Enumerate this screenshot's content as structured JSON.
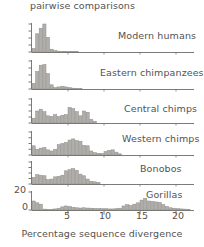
{
  "figure": {
    "y_axis_partial_label": "pairwise comparisons",
    "x_axis_title": "Percentage sequence divergence",
    "bar_color": "#b0aeaa",
    "bar_stroke": "#8f8d89",
    "axis_color": "#6e6c69",
    "text_color": "#555250",
    "background": "#ffffff"
  },
  "chart_data": {
    "type": "bar",
    "xlabel": "Percentage sequence divergence",
    "ylabel": "pairwise comparisons",
    "xlim": [
      0,
      22.5
    ],
    "xticks": [
      5,
      10,
      15,
      20
    ],
    "xtick_labels": [
      "5",
      "10",
      "15",
      "20"
    ],
    "grid": false,
    "legend": "none",
    "panel_layout": "stacked-vertical-shared-x",
    "bin_width": 0.5,
    "panels": [
      {
        "name": "Modern humans",
        "label": "Modern humans",
        "ylim": [
          0,
          20
        ],
        "yticks": [
          0,
          5,
          10,
          15,
          20
        ],
        "ytick_labels": [
          "",
          "",
          "",
          "",
          ""
        ],
        "x": [
          0.25,
          0.75,
          1.25,
          1.75,
          2.25,
          2.75,
          3.25,
          3.75,
          4.25,
          4.75,
          5.25,
          5.75,
          6.25
        ],
        "values": [
          2.5,
          13,
          17,
          20,
          10.5,
          2,
          1,
          0.6,
          0.5,
          0.4,
          0.3,
          0.2,
          0.2
        ]
      },
      {
        "name": "Eastern chimpanzees",
        "label": "Eastern chimpanzees",
        "ylim": [
          0,
          20
        ],
        "yticks": [
          0,
          5,
          10,
          15,
          20
        ],
        "ytick_labels": [
          "",
          "",
          "",
          "",
          ""
        ],
        "x": [
          0.25,
          0.75,
          1.25,
          1.75,
          2.25,
          2.75,
          3.25,
          3.75,
          4.25,
          4.75,
          5.25,
          5.75,
          6.25,
          6.75
        ],
        "values": [
          4,
          12.5,
          17,
          17.5,
          11,
          3,
          1,
          1.5,
          2,
          1.5,
          1,
          0.6,
          0.4,
          0.3
        ]
      },
      {
        "name": "Central chimps",
        "label": "Central chimps",
        "ylim": [
          0,
          20
        ],
        "yticks": [
          0,
          5,
          10,
          15,
          20
        ],
        "ytick_labels": [
          "",
          "",
          "",
          "",
          ""
        ],
        "x": [
          0.25,
          0.75,
          1.25,
          1.75,
          2.25,
          2.75,
          3.25,
          3.75,
          4.25,
          4.75,
          5.25,
          5.75,
          6.25,
          6.75,
          7.25,
          7.75,
          8.25,
          8.75
        ],
        "values": [
          4,
          10,
          11.5,
          9.5,
          6,
          5.5,
          7,
          5.5,
          6.5,
          7,
          13,
          12,
          9.5,
          6,
          10,
          9,
          3,
          1.5
        ]
      },
      {
        "name": "Western chimps",
        "label": "Western chimps",
        "ylim": [
          0,
          20
        ],
        "yticks": [
          0,
          5,
          10,
          15,
          20
        ],
        "ytick_labels": [
          "",
          "",
          "",
          "",
          ""
        ],
        "x": [
          0.25,
          0.75,
          1.25,
          1.75,
          2.25,
          2.75,
          3.25,
          3.75,
          4.25,
          4.75,
          5.25,
          5.75,
          6.25,
          6.75,
          7.25,
          7.75,
          8.25,
          8.75,
          9.25,
          9.75,
          10.25,
          10.75,
          11.25,
          11.75,
          12.25
        ],
        "values": [
          8,
          5,
          6,
          6.5,
          4.5,
          3.5,
          5,
          9,
          10,
          11,
          13,
          14,
          12.5,
          12,
          8.5,
          8,
          3.5,
          2,
          1.5,
          1.2,
          3,
          4,
          4.5,
          2.5,
          1
        ]
      },
      {
        "name": "Bonobos",
        "label": "Bonobos",
        "ylim": [
          0,
          20
        ],
        "yticks": [
          0,
          5,
          10,
          15,
          20
        ],
        "ytick_labels": [
          "",
          "",
          "",
          "",
          ""
        ],
        "x": [
          0.25,
          0.75,
          1.25,
          1.75,
          2.25,
          2.75,
          3.25,
          3.75,
          4.25,
          4.75,
          5.25,
          5.75,
          6.25,
          6.75,
          7.25,
          7.75,
          8.25,
          8.75,
          9.25
        ],
        "values": [
          6,
          8.5,
          8,
          7.5,
          4,
          4.5,
          6.5,
          7,
          8,
          12,
          13,
          14,
          12.5,
          9,
          7.5,
          4.5,
          2.5,
          2,
          1.5
        ]
      },
      {
        "name": "Gorillas",
        "label": "Gorillas",
        "ylim": [
          0,
          20
        ],
        "yticks": [
          0,
          20
        ],
        "ytick_labels": [
          "0",
          "20"
        ],
        "x": [
          0.25,
          0.75,
          1.25,
          1.75,
          2.25,
          2.75,
          3.25,
          3.75,
          4.25,
          4.75,
          5.25,
          5.75,
          6.25,
          6.75,
          7.25,
          7.75,
          8.25,
          8.75,
          9.25,
          9.75,
          10.25,
          10.75,
          11.25,
          11.75,
          12.25,
          12.75,
          13.25,
          13.75,
          14.25,
          14.75,
          15.25,
          15.75,
          16.25,
          16.75,
          17.25,
          17.75,
          18.25,
          18.75,
          19.25,
          19.75,
          20.25,
          20.75,
          21.25,
          21.75
        ],
        "values": [
          10,
          8,
          6.5,
          1,
          0.5,
          0.8,
          1.2,
          2,
          3.5,
          4.5,
          4,
          3,
          2.5,
          2.2,
          2.5,
          2.2,
          2,
          1.8,
          1.6,
          1.5,
          1.4,
          1.2,
          1.2,
          1.5,
          2,
          4.5,
          6,
          5,
          6.5,
          8,
          11,
          13,
          10,
          9.5,
          9,
          8.5,
          6,
          4,
          2.5,
          2,
          1.5,
          1.2,
          1,
          0.8
        ]
      }
    ]
  }
}
